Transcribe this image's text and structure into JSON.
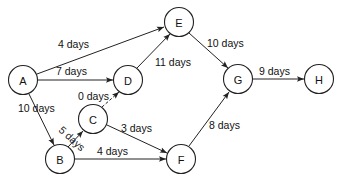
{
  "diagram": {
    "type": "activity-network",
    "nodes": [
      {
        "id": "A",
        "label": "A",
        "x": 23,
        "y": 80
      },
      {
        "id": "B",
        "label": "B",
        "x": 60,
        "y": 159
      },
      {
        "id": "C",
        "label": "C",
        "x": 93,
        "y": 119
      },
      {
        "id": "D",
        "label": "D",
        "x": 128,
        "y": 80
      },
      {
        "id": "E",
        "label": "E",
        "x": 179,
        "y": 22
      },
      {
        "id": "F",
        "label": "F",
        "x": 181,
        "y": 159
      },
      {
        "id": "G",
        "label": "G",
        "x": 238,
        "y": 79
      },
      {
        "id": "H",
        "label": "H",
        "x": 319,
        "y": 79
      }
    ],
    "edges": [
      {
        "from": "A",
        "to": "E",
        "label": "4 days",
        "dashed": false
      },
      {
        "from": "A",
        "to": "D",
        "label": "7 days",
        "dashed": false
      },
      {
        "from": "A",
        "to": "B",
        "label": "10 days",
        "dashed": false
      },
      {
        "from": "D",
        "to": "E",
        "label": "11 days",
        "dashed": false
      },
      {
        "from": "C",
        "to": "D",
        "label": "0 days",
        "dashed": true
      },
      {
        "from": "B",
        "to": "C",
        "label": "5 days",
        "dashed": false
      },
      {
        "from": "C",
        "to": "F",
        "label": "3 days",
        "dashed": false
      },
      {
        "from": "B",
        "to": "F",
        "label": "4 days",
        "dashed": false
      },
      {
        "from": "E",
        "to": "G",
        "label": "10 days",
        "dashed": false
      },
      {
        "from": "F",
        "to": "G",
        "label": "8 days",
        "dashed": false
      },
      {
        "from": "G",
        "to": "H",
        "label": "9 days",
        "dashed": false
      }
    ]
  }
}
